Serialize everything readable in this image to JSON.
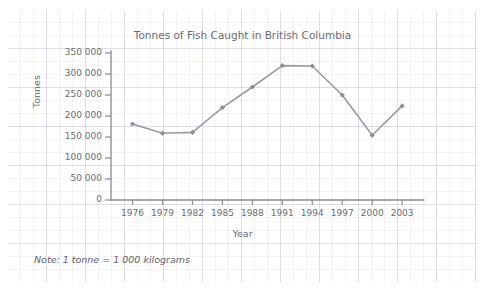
{
  "chart_data": {
    "type": "line",
    "title": "Tonnes of Fish Caught in British Columbia",
    "xlabel": "Year",
    "ylabel": "Tonnes",
    "categories": [
      "1976",
      "1979",
      "1982",
      "1985",
      "1988",
      "1991",
      "1994",
      "1997",
      "2000",
      "2003"
    ],
    "values": [
      181000,
      159000,
      161000,
      220000,
      269000,
      320000,
      319000,
      250000,
      154000,
      224000
    ],
    "ylim": [
      0,
      350000
    ],
    "ytick_values": [
      0,
      50000,
      100000,
      150000,
      200000,
      250000,
      300000,
      350000
    ],
    "ytick_labels": [
      "0",
      "50 000",
      "100 000",
      "150 000",
      "200 000",
      "250 000",
      "300 000",
      "350 000"
    ],
    "xtick_labels": [
      "1976",
      "1979",
      "1982",
      "1985",
      "1988",
      "1991",
      "1994",
      "1997",
      "2000",
      "2003"
    ],
    "grid": false,
    "legend": null,
    "marker": "diamond",
    "line_color": "#9a9aa0",
    "marker_color": "#8e8e96",
    "axis_color": "#8b8b93",
    "background": "graph-paper"
  },
  "annotations": {
    "note": "Note: 1 tonne = 1 000 kilograms"
  },
  "colors": {
    "text": "#6d6d73",
    "grid_major": "#bdb4c8",
    "grid_minor": "#b9afc8",
    "paper": "#ffffff"
  }
}
